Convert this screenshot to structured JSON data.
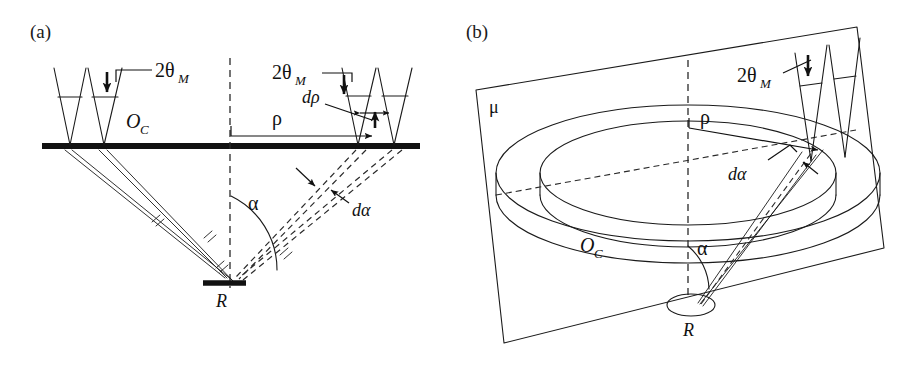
{
  "figure": {
    "type": "scientific-diagram",
    "width": 920,
    "height": 365,
    "background_color": "#ffffff",
    "ink_color": "#111111"
  },
  "panels": [
    {
      "id": "a",
      "label": "(a)",
      "view": "cross-section",
      "labels": {
        "two_theta_left": "2θ",
        "two_theta_left_sub": "M",
        "two_theta_right": "2θ",
        "two_theta_right_sub": "M",
        "crystal_plane": "O",
        "crystal_plane_sub": "C",
        "radius": "ρ",
        "radius_increment": "dρ",
        "angle": "α",
        "angle_increment": "dα",
        "source": "R"
      },
      "elements": {
        "horizontal_bar": "crystal array plane O_C",
        "vertical_dashed": "optical axis",
        "solid_ray_bundle": "rays from left crystals to source R",
        "dashed_ray_bundle": "rays from right crystals to source R",
        "angle_arc": "angle alpha between axis and ray",
        "source_bar": "detector / source R",
        "left_crystals": 2,
        "right_crystals": 2,
        "hatch_ticks": 4
      }
    },
    {
      "id": "b",
      "label": "(b)",
      "view": "three-dimensional-perspective",
      "labels": {
        "two_theta": "2θ",
        "two_theta_sub": "M",
        "plane": "μ",
        "crystal_plane": "O",
        "crystal_plane_sub": "C",
        "radius": "ρ",
        "angle": "α",
        "angle_increment": "dα",
        "source": "R"
      },
      "elements": {
        "tilted_plane": "plane mu",
        "annulus": "concentric ellipse pair forming ring O_C",
        "axis_dashed": "vertical dashed optical axis",
        "diameter_dashed": "dashed ellipse diameter",
        "ray_wedge": "narrow ray wedge from R to crystals",
        "source_ellipse": "source R",
        "crystals": 2
      }
    }
  ],
  "symbols": {
    "theta": "θ",
    "rho": "ρ",
    "alpha": "α",
    "mu": "μ",
    "differential": "d",
    "subscript_M": "M",
    "subscript_C": "C"
  }
}
